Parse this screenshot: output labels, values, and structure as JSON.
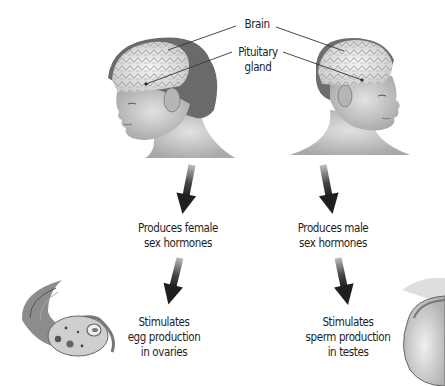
{
  "figure": {
    "labels": {
      "brain": "Brain",
      "pituitary": [
        "Pituitary",
        "gland"
      ]
    },
    "female": {
      "subject": "girl-head",
      "step1": [
        "Produces female",
        "sex hormones"
      ],
      "step2": [
        "Stimulates",
        "egg production",
        "in ovaries"
      ],
      "organ": "ovary"
    },
    "male": {
      "subject": "boy-head",
      "step1": [
        "Produces male",
        "sex hormones"
      ],
      "step2": [
        "Stimulates",
        "sperm production",
        "in testes"
      ],
      "organ": "testis"
    },
    "colors": {
      "text": "#1e1e1e",
      "arrow": "#2a2a2a",
      "leader": "#333333",
      "brain": "#e8e8e8",
      "hair": "#6a6a6a",
      "skin": "#cfcfcf"
    }
  }
}
